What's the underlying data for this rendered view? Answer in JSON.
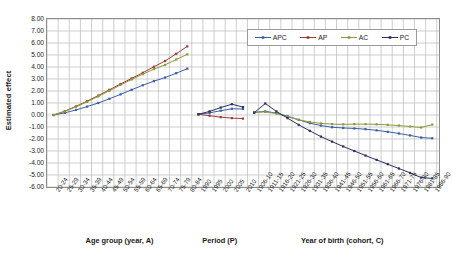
{
  "chart_data": {
    "type": "line",
    "title": "",
    "ylabel": "Estimated effect",
    "ylim": [
      -6,
      8
    ],
    "ytick_labels": [
      "8.00",
      "7.00",
      "6.00",
      "5.00",
      "4.00",
      "3.00",
      "2.00",
      "1.00",
      "0.00",
      "-1.00",
      "-2.00",
      "-3.00",
      "-4.00",
      "-5.00",
      "-6.00"
    ],
    "grid": true,
    "legend_position": "top-right",
    "legend": [
      {
        "name": "APC",
        "color": "#3a5fa8"
      },
      {
        "name": "AP",
        "color": "#a33a3a"
      },
      {
        "name": "AC",
        "color": "#8a9a3a"
      },
      {
        "name": "PC",
        "color": "#2b3060"
      }
    ],
    "panels": [
      {
        "id": "age",
        "xlabel": "Age group (year, A)",
        "categories": [
          "20-24",
          "25-29",
          "30-34",
          "35-39",
          "40-44",
          "45-49",
          "50-54",
          "55-59",
          "60-64",
          "65-69",
          "70-74",
          "75-79",
          "80-84"
        ],
        "series": [
          {
            "name": "APC",
            "color": "#3a5fa8",
            "values": [
              0.0,
              0.18,
              0.42,
              0.7,
              1.0,
              1.35,
              1.72,
              2.1,
              2.48,
              2.82,
              3.12,
              3.48,
              3.86
            ]
          },
          {
            "name": "AP",
            "color": "#a33a3a",
            "values": [
              0.0,
              0.32,
              0.72,
              1.15,
              1.62,
              2.1,
              2.58,
              3.05,
              3.52,
              4.02,
              4.5,
              5.1,
              5.72
            ]
          },
          {
            "name": "AC",
            "color": "#8a9a3a",
            "values": [
              0.0,
              0.3,
              0.68,
              1.1,
              1.55,
              2.02,
              2.5,
              2.96,
              3.4,
              3.82,
              4.18,
              4.62,
              5.06
            ]
          }
        ]
      },
      {
        "id": "period",
        "xlabel": "Period (P)",
        "categories": [
          "1990",
          "1995",
          "2000",
          "2005",
          "2010"
        ],
        "series": [
          {
            "name": "APC",
            "color": "#3a5fa8",
            "values": [
              0.06,
              0.18,
              0.36,
              0.52,
              0.5
            ]
          },
          {
            "name": "AP",
            "color": "#a33a3a",
            "values": [
              0.06,
              -0.06,
              -0.18,
              -0.26,
              -0.3
            ]
          },
          {
            "name": "PC",
            "color": "#2b3060",
            "values": [
              0.06,
              0.3,
              0.62,
              0.9,
              0.66
            ]
          }
        ]
      },
      {
        "id": "cohort",
        "xlabel": "Year of birth (cohort, C)",
        "categories": [
          "1906-10",
          "1911-15",
          "1916-20",
          "1921-25",
          "1926-30",
          "1931-35",
          "1936-40",
          "1941-45",
          "1946-50",
          "1951-55",
          "1956-60",
          "1961-65",
          "1966-70",
          "1971-75",
          "1976-80",
          "1981-85",
          "1986-90"
        ],
        "series": [
          {
            "name": "APC",
            "color": "#3a5fa8",
            "values": [
              0.22,
              0.3,
              0.16,
              -0.1,
              -0.4,
              -0.68,
              -0.88,
              -1.02,
              -1.08,
              -1.12,
              -1.18,
              -1.28,
              -1.4,
              -1.54,
              -1.7,
              -1.88,
              -1.94
            ]
          },
          {
            "name": "AC",
            "color": "#8a9a3a",
            "values": [
              0.22,
              0.26,
              0.12,
              -0.14,
              -0.4,
              -0.58,
              -0.7,
              -0.76,
              -0.78,
              -0.76,
              -0.76,
              -0.78,
              -0.82,
              -0.88,
              -0.96,
              -1.04,
              -0.8
            ]
          },
          {
            "name": "PC",
            "color": "#2b3060",
            "values": [
              0.18,
              0.96,
              0.3,
              -0.26,
              -0.82,
              -1.32,
              -1.8,
              -2.22,
              -2.62,
              -3.0,
              -3.38,
              -3.74,
              -4.1,
              -4.46,
              -4.82,
              -5.22,
              -5.28
            ]
          }
        ]
      }
    ]
  }
}
